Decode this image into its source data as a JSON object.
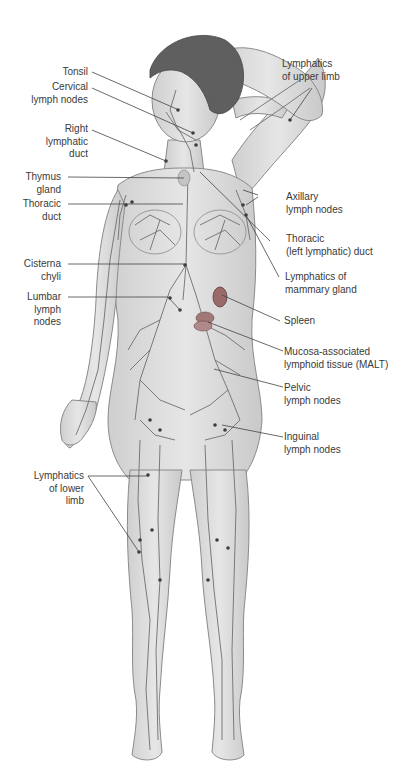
{
  "diagram": {
    "colors": {
      "skin": "#dcdcdc",
      "skin_outline": "#8a8a8a",
      "vessel": "#6e6e6e",
      "node": "#3c3c3c",
      "hair": "#5a5a5a",
      "organ": "#9a6a6a",
      "leader_line": "#444444",
      "text": "#3a3a3a"
    },
    "labels_left": [
      {
        "id": "tonsil",
        "lines": [
          "Tonsil"
        ]
      },
      {
        "id": "cervical",
        "lines": [
          "Cervical",
          "lymph nodes"
        ]
      },
      {
        "id": "right-lymphatic-duct",
        "lines": [
          "Right",
          "lymphatic",
          "duct"
        ]
      },
      {
        "id": "thymus",
        "lines": [
          "Thymus",
          "gland"
        ]
      },
      {
        "id": "thoracic-duct",
        "lines": [
          "Thoracic",
          "duct"
        ]
      },
      {
        "id": "cisterna-chyli",
        "lines": [
          "Cisterna",
          "chyli"
        ]
      },
      {
        "id": "lumbar",
        "lines": [
          "Lumbar",
          "lymph",
          "nodes"
        ]
      },
      {
        "id": "lower-limb",
        "lines": [
          "Lymphatics",
          "of lower",
          "limb"
        ]
      }
    ],
    "labels_right": [
      {
        "id": "upper-limb",
        "lines": [
          "Lymphatics",
          "of upper limb"
        ]
      },
      {
        "id": "axillary",
        "lines": [
          "Axillary",
          "lymph nodes"
        ]
      },
      {
        "id": "thoracic-left",
        "lines": [
          "Thoracic",
          "(left lymphatic) duct"
        ]
      },
      {
        "id": "mammary",
        "lines": [
          "Lymphatics of",
          "mammary gland"
        ]
      },
      {
        "id": "spleen",
        "lines": [
          "Spleen"
        ]
      },
      {
        "id": "malt",
        "lines": [
          "Mucosa-associated",
          "lymphoid tissue (MALT)"
        ]
      },
      {
        "id": "pelvic",
        "lines": [
          "Pelvic",
          "lymph nodes"
        ]
      },
      {
        "id": "inguinal",
        "lines": [
          "Inguinal",
          "lymph nodes"
        ]
      }
    ]
  }
}
